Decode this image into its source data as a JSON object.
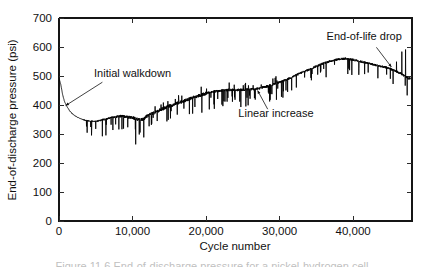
{
  "figure": {
    "caption_partial": "Figure 11.6  End-of-discharge pressure for a nickel-hydrogen cell"
  },
  "chart_data": {
    "type": "line",
    "title": "",
    "xlabel": "Cycle number",
    "ylabel": "End-of-discharge pressure (psi)",
    "xlim": [
      0,
      48000
    ],
    "ylim": [
      0,
      700
    ],
    "xticks": [
      0,
      10000,
      20000,
      30000,
      40000
    ],
    "xtick_labels": [
      "0",
      "10,000",
      "20,000",
      "30,000",
      "40,000"
    ],
    "yticks": [
      0,
      100,
      200,
      300,
      400,
      500,
      600,
      700
    ],
    "ytick_labels": [
      "0",
      "100",
      "200",
      "300",
      "400",
      "500",
      "600",
      "700"
    ],
    "grid": false,
    "legend": "none",
    "series_name": "End-of-discharge pressure",
    "line_color": "#000000",
    "annotations": [
      {
        "name": "initial-walkdown",
        "text": "Initial walkdown",
        "label_x": 10000,
        "label_y": 497,
        "point_x": 900,
        "point_y": 398
      },
      {
        "name": "linear-increase",
        "text": "Linear increase",
        "label_x": 29500,
        "label_y": 358,
        "point_x": 27000,
        "point_y": 450
      },
      {
        "name": "end-of-life-drop",
        "text": "End-of-life drop",
        "label_x": 41500,
        "label_y": 624,
        "point_x": 45200,
        "point_y": 531
      }
    ],
    "x": [
      0,
      250,
      500,
      750,
      1000,
      1250,
      1500,
      1750,
      2000,
      2500,
      3000,
      3500,
      4000,
      4500,
      5000,
      5500,
      6000,
      6500,
      7000,
      7500,
      8000,
      8500,
      9000,
      9500,
      10000,
      10500,
      11000,
      11500,
      12000,
      13000,
      14000,
      15000,
      16000,
      17000,
      18000,
      19000,
      20000,
      21000,
      22000,
      23000,
      24000,
      25000,
      26000,
      27000,
      28000,
      29000,
      30000,
      31000,
      32000,
      33000,
      34000,
      35000,
      36000,
      37000,
      38000,
      39000,
      40000,
      41000,
      42000,
      43000,
      44000,
      45000,
      45500,
      46000,
      46500,
      47000,
      47500
    ],
    "y": [
      492,
      470,
      435,
      412,
      398,
      388,
      378,
      372,
      366,
      358,
      352,
      348,
      345,
      344,
      344,
      346,
      350,
      352,
      356,
      358,
      360,
      362,
      360,
      358,
      356,
      352,
      348,
      352,
      362,
      374,
      386,
      396,
      406,
      414,
      424,
      432,
      440,
      446,
      450,
      452,
      452,
      452,
      454,
      456,
      462,
      470,
      478,
      488,
      500,
      512,
      522,
      534,
      544,
      552,
      558,
      560,
      556,
      550,
      544,
      538,
      532,
      526,
      520,
      514,
      508,
      500,
      492
    ],
    "noise_description": "Dense high-frequency noise with frequent sharp downward spikes; amplitude grows after cycle ~4,000; large spike cluster near 11,000 reaching ~280 psi and near 46,500 reaching ~600 psi",
    "notable_features": {
      "start_value": 492,
      "walkdown_minimum": 344,
      "peak_value": 568,
      "peak_cycle": 38500,
      "final_value": 490,
      "max_cycle": 47800
    }
  },
  "axes": {
    "x_axis_name": "cycle-number-axis",
    "y_axis_name": "pressure-axis"
  }
}
